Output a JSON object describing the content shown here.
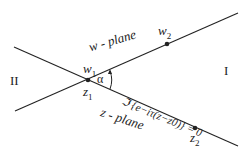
{
  "diagram": {
    "regions": {
      "left": "II",
      "right": "I"
    },
    "planes": {
      "w": "w - plane",
      "z": "z - plane"
    },
    "points": {
      "w1": "w",
      "w1_sub": "1",
      "w2": "w",
      "w2_sub": "2",
      "z1": "z",
      "z1_sub": "1",
      "z2": "z",
      "z2_sub": "2"
    },
    "angle": "α",
    "equation": "ℑ{e^{−iτ(z−z₀)}} = 0",
    "equation_display": "ℑ {e−iτ(z−z0)} = 0"
  }
}
